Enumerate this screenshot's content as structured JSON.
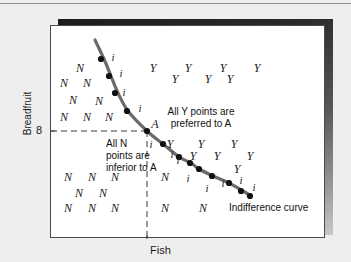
{
  "figure": {
    "title": "",
    "axes": {
      "x_label": "Fish",
      "y_label": "Breadfruit",
      "x_tick_label": "8",
      "y_tick_label": "8"
    },
    "annotations": {
      "point_a_label": "A",
      "curve_label": "Indifference curve",
      "preferred_note_line1": "All Y points are",
      "preferred_note_line2": "preferred to A",
      "inferior_note_line1": "All N",
      "inferior_note_line2": "points are",
      "inferior_note_line3": "inferior to A"
    },
    "colors": {
      "curve": "#6b6b6b",
      "dot": "#111111",
      "panel_border": "#4a4a4a",
      "page_background": "#eeeeee",
      "panel_background": "#ffffff",
      "dashed_line": "#3a3a3a"
    }
  },
  "chart_data": {
    "type": "scatter",
    "xlabel": "Fish",
    "ylabel": "Breadfruit",
    "xlim": [
      0,
      275
    ],
    "ylim": [
      0,
      213
    ],
    "grid": false,
    "legend": "none",
    "reference_point": {
      "label": "A",
      "x": 96,
      "y": 105,
      "x_value": "8",
      "y_value": "8"
    },
    "dashed_guides": {
      "horizontal_y": 105,
      "horizontal_x_from": 0,
      "horizontal_x_to": 96,
      "vertical_x": 96,
      "vertical_y_from": 105,
      "vertical_y_to": 213
    },
    "curve_points": [
      {
        "x": 44,
        "y": 14
      },
      {
        "x": 53,
        "y": 33
      },
      {
        "x": 60,
        "y": 50
      },
      {
        "x": 67,
        "y": 67
      },
      {
        "x": 77,
        "y": 85
      },
      {
        "x": 96,
        "y": 105
      },
      {
        "x": 112,
        "y": 118
      },
      {
        "x": 128,
        "y": 131
      },
      {
        "x": 140,
        "y": 137
      },
      {
        "x": 148,
        "y": 143
      },
      {
        "x": 162,
        "y": 150
      },
      {
        "x": 178,
        "y": 157
      },
      {
        "x": 192,
        "y": 165
      },
      {
        "x": 200,
        "y": 170
      }
    ],
    "curve_dots": [
      {
        "x": 50,
        "y": 33
      },
      {
        "x": 58,
        "y": 50
      },
      {
        "x": 64,
        "y": 67
      },
      {
        "x": 76,
        "y": 85
      },
      {
        "x": 96,
        "y": 105
      },
      {
        "x": 112,
        "y": 118
      },
      {
        "x": 128,
        "y": 131
      },
      {
        "x": 139,
        "y": 137
      },
      {
        "x": 148,
        "y": 143
      },
      {
        "x": 161,
        "y": 150
      },
      {
        "x": 178,
        "y": 157
      },
      {
        "x": 190,
        "y": 165
      },
      {
        "x": 199,
        "y": 170
      }
    ],
    "markers": [
      {
        "label": "i",
        "x": 62,
        "y": 31
      },
      {
        "label": "i",
        "x": 70,
        "y": 47
      },
      {
        "label": "i",
        "x": 73,
        "y": 66
      },
      {
        "label": "i",
        "x": 89,
        "y": 82
      },
      {
        "label": "i",
        "x": 100,
        "y": 118
      },
      {
        "label": "i",
        "x": 121,
        "y": 128
      },
      {
        "label": "i",
        "x": 127,
        "y": 134
      },
      {
        "label": "i",
        "x": 137,
        "y": 152
      },
      {
        "label": "i",
        "x": 156,
        "y": 162
      },
      {
        "label": "i",
        "x": 172,
        "y": 157
      },
      {
        "label": "i",
        "x": 190,
        "y": 154
      },
      {
        "label": "i",
        "x": 203,
        "y": 161
      },
      {
        "label": "N",
        "x": 29,
        "y": 42
      },
      {
        "label": "N",
        "x": 13,
        "y": 57
      },
      {
        "label": "N",
        "x": 36,
        "y": 57
      },
      {
        "label": "N",
        "x": 22,
        "y": 74
      },
      {
        "label": "N",
        "x": 48,
        "y": 75
      },
      {
        "label": "N",
        "x": 13,
        "y": 91
      },
      {
        "label": "N",
        "x": 36,
        "y": 91
      },
      {
        "label": "N",
        "x": 58,
        "y": 91
      },
      {
        "label": "N",
        "x": 17,
        "y": 151
      },
      {
        "label": "N",
        "x": 41,
        "y": 151
      },
      {
        "label": "N",
        "x": 64,
        "y": 151
      },
      {
        "label": "N",
        "x": 28,
        "y": 167
      },
      {
        "label": "N",
        "x": 52,
        "y": 167
      },
      {
        "label": "N",
        "x": 17,
        "y": 182
      },
      {
        "label": "N",
        "x": 41,
        "y": 182
      },
      {
        "label": "N",
        "x": 64,
        "y": 182
      },
      {
        "label": "N",
        "x": 114,
        "y": 151
      },
      {
        "label": "N",
        "x": 114,
        "y": 182
      },
      {
        "label": "N",
        "x": 152,
        "y": 182
      },
      {
        "label": "Y",
        "x": 102,
        "y": 42
      },
      {
        "label": "Y",
        "x": 137,
        "y": 42
      },
      {
        "label": "Y",
        "x": 172,
        "y": 42
      },
      {
        "label": "Y",
        "x": 206,
        "y": 42
      },
      {
        "label": "Y",
        "x": 124,
        "y": 53
      },
      {
        "label": "Y",
        "x": 157,
        "y": 53
      },
      {
        "label": "Y",
        "x": 179,
        "y": 53
      },
      {
        "label": "Y",
        "x": 119,
        "y": 118
      },
      {
        "label": "Y",
        "x": 150,
        "y": 118
      },
      {
        "label": "Y",
        "x": 183,
        "y": 118
      },
      {
        "label": "Y",
        "x": 142,
        "y": 130
      },
      {
        "label": "Y",
        "x": 166,
        "y": 130
      },
      {
        "label": "Y",
        "x": 199,
        "y": 130
      },
      {
        "label": "Y",
        "x": 186,
        "y": 143
      }
    ]
  }
}
